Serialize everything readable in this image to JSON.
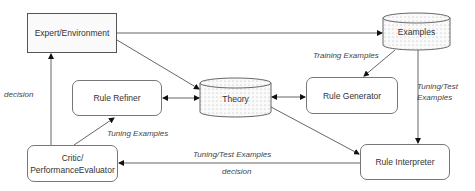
{
  "diagram": {
    "nodes": {
      "expert": {
        "label": "Expert/Environment",
        "shape": "rectangle-dotted"
      },
      "examples": {
        "label": "Examples",
        "shape": "cylinder-dotted"
      },
      "theory": {
        "label": "Theory",
        "shape": "cylinder-dotted"
      },
      "rule_refiner": {
        "label": "Rule Refiner",
        "shape": "rounded-rectangle"
      },
      "rule_generator": {
        "label": "Rule Generator",
        "shape": "rounded-rectangle"
      },
      "rule_interpreter": {
        "label": "Rule Interpreter",
        "shape": "rounded-rectangle"
      },
      "critic_line1": {
        "label": "Critic/"
      },
      "critic_line2": {
        "label": "PerformanceEvaluator"
      }
    },
    "edge_labels": {
      "training_examples": "Training Examples",
      "tuning_test_examples_right_1": "Tuning/Test",
      "tuning_test_examples_right_2": "Examples",
      "tuning_examples": "Tuning Examples",
      "tuning_test_examples_bottom": "Tuning/Test Examples",
      "decision_bottom": "decision",
      "decision_left": "decision"
    },
    "edges": [
      {
        "from": "Expert/Environment",
        "to": "Examples"
      },
      {
        "from": "Expert/Environment",
        "to": "Theory"
      },
      {
        "from": "Examples",
        "to": "Rule Generator",
        "label": "Training Examples"
      },
      {
        "from": "Examples",
        "to": "Rule Interpreter",
        "label": "Tuning/Test Examples"
      },
      {
        "from": "Rule Refiner",
        "to": "Theory",
        "bidirectional": true
      },
      {
        "from": "Theory",
        "to": "Rule Generator",
        "bidirectional": true
      },
      {
        "from": "Theory",
        "to": "Rule Interpreter"
      },
      {
        "from": "Rule Interpreter",
        "to": "Critic/PerformanceEvaluator",
        "label": "Tuning/Test Examples / decision"
      },
      {
        "from": "Critic/PerformanceEvaluator",
        "to": "Rule Refiner",
        "label": "Tuning Examples"
      },
      {
        "from": "Critic/PerformanceEvaluator",
        "to": "Expert/Environment",
        "label": "decision"
      }
    ]
  }
}
